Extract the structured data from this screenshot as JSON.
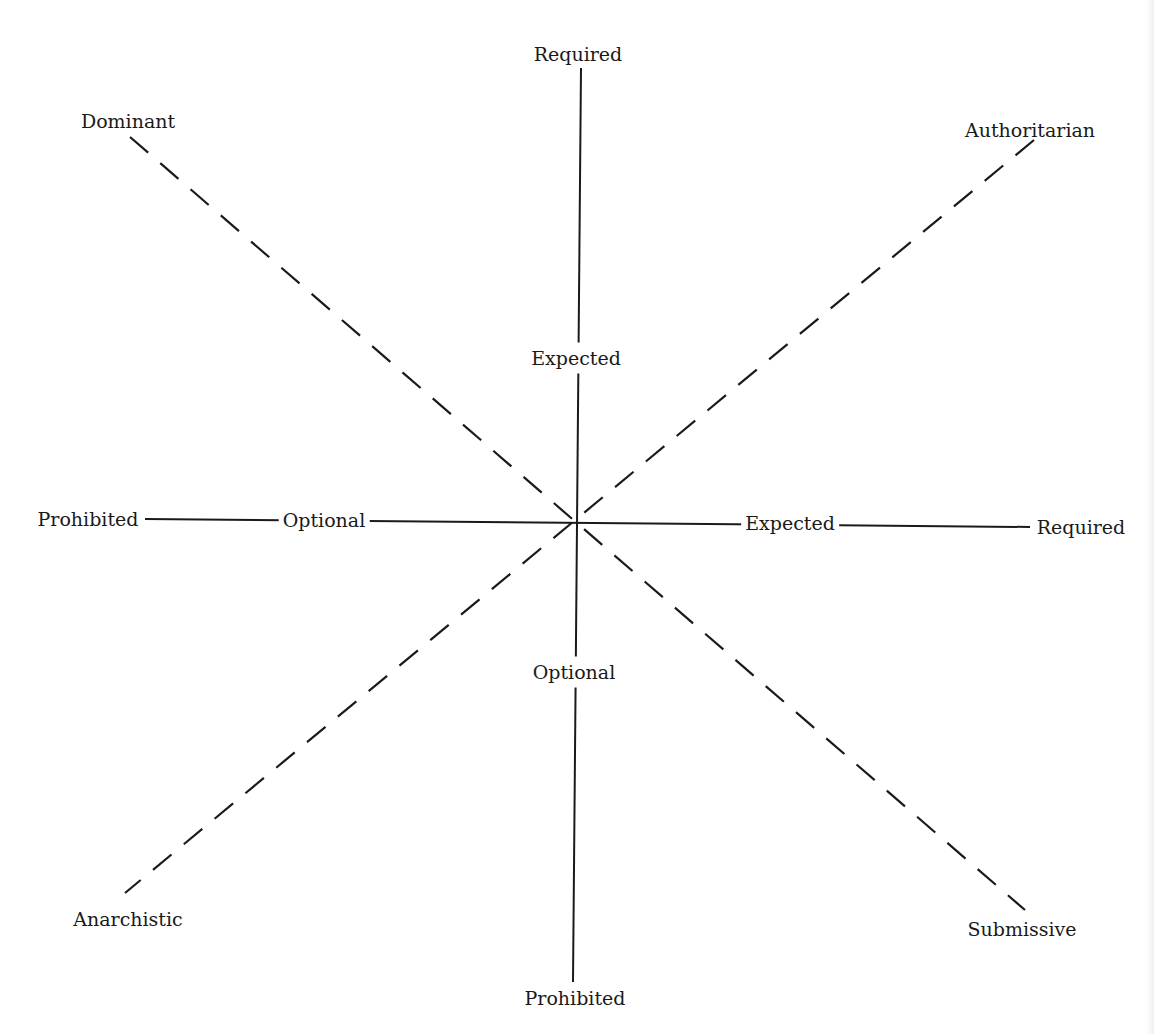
{
  "diagram": {
    "type": "axis-diagram",
    "colors": {
      "line": "#1a1a1a",
      "background": "#ffffff"
    },
    "center": {
      "x": 578,
      "y": 522
    },
    "vertical_axis": {
      "style": "solid",
      "top_label": "Required",
      "upper_mid_label": "Expected",
      "lower_mid_label": "Optional",
      "bottom_label": "Prohibited"
    },
    "horizontal_axis": {
      "style": "solid",
      "left_label": "Prohibited",
      "left_mid_label": "Optional",
      "right_mid_label": "Expected",
      "right_label": "Required"
    },
    "diagonal_1": {
      "style": "dashed",
      "top_left_label": "Dominant",
      "bottom_right_label": "Submissive"
    },
    "diagonal_2": {
      "style": "dashed",
      "top_right_label": "Authoritarian",
      "bottom_left_label": "Anarchistic"
    }
  }
}
